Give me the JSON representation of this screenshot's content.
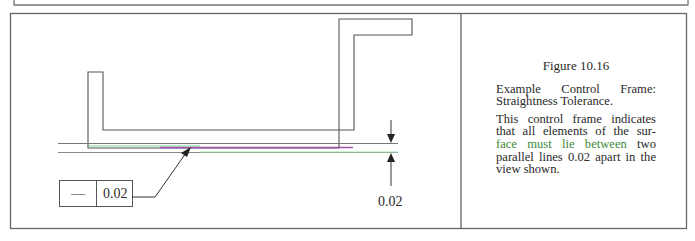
{
  "figure": {
    "number_label": "Figure 10.16",
    "title": "Example Control Frame: Straightness Tolerance.",
    "description_before_highlight": "This control frame indicates that all elements of the sur-",
    "description_highlight": "face must lie between",
    "description_after_highlight": " two parallel lines 0.02 apart in the view shown."
  },
  "drawing": {
    "control_frame": {
      "symbol": "—",
      "symbol_meaning": "straightness",
      "tolerance_value": "0.02"
    },
    "dimension_label": "0.02"
  },
  "colors": {
    "line": "#555555",
    "frame": "#666666",
    "surface_highlight": "#a050b0",
    "tolerance_zone": "#7ad88a",
    "highlight_text": "#3d8a3a"
  },
  "icons": {
    "arrow_down": "dimension-arrow-down-icon",
    "arrow_up": "dimension-arrow-up-icon",
    "leader_arrow": "leader-arrow-icon"
  }
}
